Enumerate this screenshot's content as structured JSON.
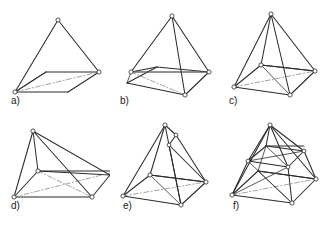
{
  "figure": {
    "background_color": "#ffffff",
    "edge_color": "#2b2b2b",
    "hidden_edge_color": "#8d8d8d",
    "vertex_fill": "#ffffff",
    "width": 328,
    "height": 227,
    "columns": 3,
    "rows": 2
  },
  "panels": [
    {
      "id": "a",
      "label": "a)",
      "description": "Square base parallelogram with a single apex above the left-rear corner; one base diagonal drawn as a hidden dash-dot line.",
      "vertex_count": 4,
      "solid_edge_count": 7,
      "hidden_edge_count": 1
    },
    {
      "id": "b",
      "label": "b)",
      "description": "Pyramid of panel a with an additional front-bottom vertex connected to the apex and to the left base corner.",
      "vertex_count": 5,
      "solid_edge_count": 10,
      "hidden_edge_count": 2
    },
    {
      "id": "c",
      "label": "c)",
      "description": "Square pyramid with both base diagonals visible, apex connected to all four base corners.",
      "vertex_count": 5,
      "solid_edge_count": 11,
      "hidden_edge_count": 2
    },
    {
      "id": "d",
      "label": "d)",
      "description": "Wide flattened pyramid, apex shifted left, base diagonals shown as hidden dash-dot lines.",
      "vertex_count": 5,
      "solid_edge_count": 11,
      "hidden_edge_count": 3
    },
    {
      "id": "e",
      "label": "e)",
      "description": "Square pyramid with a small triangular flap folded out near the apex on the upper right face.",
      "vertex_count": 7,
      "solid_edge_count": 14,
      "hidden_edge_count": 2
    },
    {
      "id": "f",
      "label": "f)",
      "description": "Square pyramid containing an inner truncated square level; crossing braces connect the inner square to the outer base.",
      "vertex_count": 9,
      "solid_edge_count": 20,
      "hidden_edge_count": 2
    }
  ]
}
